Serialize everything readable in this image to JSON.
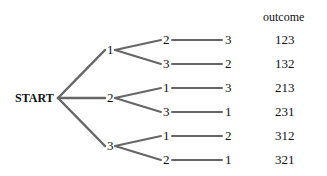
{
  "root": {
    "label": "START"
  },
  "header": {
    "outcome_label": "outcome"
  },
  "level1": [
    {
      "label": "1",
      "children": [
        {
          "label": "2",
          "leaf": "3",
          "outcome": "123"
        },
        {
          "label": "3",
          "leaf": "2",
          "outcome": "132"
        }
      ]
    },
    {
      "label": "2",
      "children": [
        {
          "label": "1",
          "leaf": "3",
          "outcome": "213"
        },
        {
          "label": "3",
          "leaf": "1",
          "outcome": "231"
        }
      ]
    },
    {
      "label": "3",
      "children": [
        {
          "label": "1",
          "leaf": "2",
          "outcome": "312"
        },
        {
          "label": "2",
          "leaf": "1",
          "outcome": "321"
        }
      ]
    }
  ]
}
